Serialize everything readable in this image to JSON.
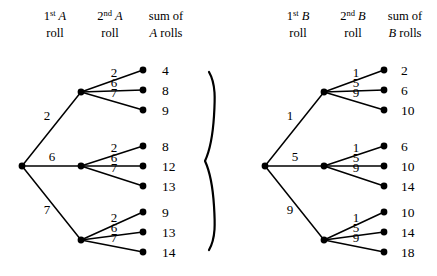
{
  "canvas": {
    "width": 437,
    "height": 276,
    "background": "#ffffff",
    "ink": "#000000"
  },
  "separator": {
    "glyph": "right-curly-brace",
    "label": "}"
  },
  "trees": [
    {
      "id": "tree-a",
      "die": "A",
      "headers": [
        {
          "ordinal_num": "1",
          "ordinal_suffix": "st",
          "letter": "A",
          "line2": "roll"
        },
        {
          "ordinal_num": "2",
          "ordinal_suffix": "nd",
          "letter": "B_placeholder",
          "line2": "roll"
        },
        {
          "line1": "sum of",
          "letter": "A",
          "line2_tail": " rolls"
        }
      ],
      "header_letter_first": "A",
      "header_letter_second": "A",
      "header_letter_sum": "A",
      "root": {
        "x": 22,
        "y": 166
      },
      "inner_x": 81,
      "leaf_x": 143,
      "sum_x": 162,
      "group_centers": [
        92,
        166,
        240
      ],
      "row_ys": [
        70,
        90,
        110,
        146,
        166,
        186,
        212,
        232,
        252
      ],
      "first_roll_labels": [
        "2",
        "6",
        "7"
      ],
      "branches": [
        {
          "first": "2",
          "first_label_pos": {
            "x": 47,
            "y": 120
          },
          "second": [
            {
              "roll": "1",
              "label": "2",
              "sum": "4"
            },
            {
              "roll": "2",
              "label": "6",
              "sum": "8"
            },
            {
              "roll": "3",
              "label": "7",
              "sum": "9"
            }
          ]
        },
        {
          "first": "6",
          "first_label_pos": {
            "x": 52,
            "y": 161
          },
          "second": [
            {
              "roll": "1",
              "label": "2",
              "sum": "8"
            },
            {
              "roll": "2",
              "label": "6",
              "sum": "12"
            },
            {
              "roll": "3",
              "label": "7",
              "sum": "13"
            }
          ]
        },
        {
          "first": "7",
          "first_label_pos": {
            "x": 47,
            "y": 214
          },
          "second": [
            {
              "roll": "1",
              "label": "2",
              "sum": "9"
            },
            {
              "roll": "2",
              "label": "6",
              "sum": "13"
            },
            {
              "roll": "3",
              "label": "7",
              "sum": "14"
            }
          ]
        }
      ]
    },
    {
      "id": "tree-b",
      "die": "B",
      "header_letter_first": "B",
      "header_letter_second": "B",
      "header_letter_sum": "B",
      "root": {
        "x": 265,
        "y": 166
      },
      "inner_x": 324,
      "leaf_x": 384,
      "sum_x": 401,
      "group_centers": [
        92,
        166,
        240
      ],
      "row_ys": [
        70,
        90,
        110,
        146,
        166,
        186,
        212,
        232,
        252
      ],
      "first_roll_labels": [
        "1",
        "5",
        "9"
      ],
      "branches": [
        {
          "first": "1",
          "first_label_pos": {
            "x": 290,
            "y": 120
          },
          "second": [
            {
              "roll": "1",
              "label": "1",
              "sum": "2"
            },
            {
              "roll": "2",
              "label": "5",
              "sum": "6"
            },
            {
              "roll": "3",
              "label": "9",
              "sum": "10"
            }
          ]
        },
        {
          "first": "5",
          "first_label_pos": {
            "x": 295,
            "y": 161
          },
          "second": [
            {
              "roll": "1",
              "label": "1",
              "sum": "6"
            },
            {
              "roll": "2",
              "label": "5",
              "sum": "10"
            },
            {
              "roll": "3",
              "label": "9",
              "sum": "14"
            }
          ]
        },
        {
          "first": "9",
          "first_label_pos": {
            "x": 290,
            "y": 214
          },
          "second": [
            {
              "roll": "1",
              "label": "1",
              "sum": "10"
            },
            {
              "roll": "2",
              "label": "5",
              "sum": "14"
            },
            {
              "roll": "3",
              "label": "9",
              "sum": "18"
            }
          ]
        }
      ]
    }
  ],
  "headers_common": {
    "ordinal_first_num": "1",
    "ordinal_first_suffix": "st",
    "ordinal_second_num": "2",
    "ordinal_second_suffix": "nd",
    "roll_word": "roll",
    "sum_of_word": "sum of",
    "rolls_word": " rolls"
  },
  "header_positions": {
    "tree_a": {
      "col1_x": 55,
      "col2_x": 110,
      "col3_x": 166
    },
    "tree_b": {
      "col1_x": 298,
      "col2_x": 353,
      "col3_x": 405
    },
    "line1_y": 20,
    "line2_y": 37
  }
}
